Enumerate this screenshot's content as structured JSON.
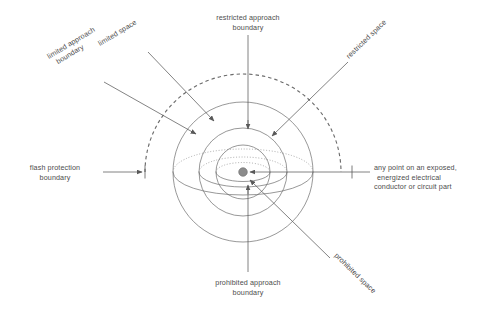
{
  "diagram": {
    "colors": {
      "background": "#ffffff",
      "line": "#6b6b6b",
      "dotted_line": "#8a8a8a",
      "leader": "#595959",
      "text": "#4d4d4d",
      "center_dot": "#8c8c8c"
    },
    "center": {
      "x": 243,
      "y": 172
    },
    "spheres": [
      {
        "name": "flash-protection-boundary",
        "radius": 98,
        "style": "dashed"
      },
      {
        "name": "limited-approach-boundary",
        "radius": 70,
        "style": "solid"
      },
      {
        "name": "restricted-approach-boundary",
        "radius": 44,
        "style": "solid"
      },
      {
        "name": "prohibited-approach-boundary",
        "radius": 26,
        "style": "solid"
      }
    ],
    "labels": {
      "limited_approach_boundary": "limited approach\nboundary",
      "limited_approach_boundary_l1": "limited approach",
      "limited_approach_boundary_l2": "boundary",
      "limited_space": "limited space",
      "restricted_approach_boundary_l1": "restricted approach",
      "restricted_approach_boundary_l2": "boundary",
      "restricted_space": "restricted space",
      "flash_protection_boundary_l1": "flash protection",
      "flash_protection_boundary_l2": "boundary",
      "any_point_l1": "any point on an exposed,",
      "any_point_l2": "energized electrical",
      "any_point_l3": "conductor or circuit part",
      "prohibited_approach_boundary_l1": "prohibited approach",
      "prohibited_approach_boundary_l2": "boundary",
      "prohibited_space": "prohibited space"
    }
  }
}
